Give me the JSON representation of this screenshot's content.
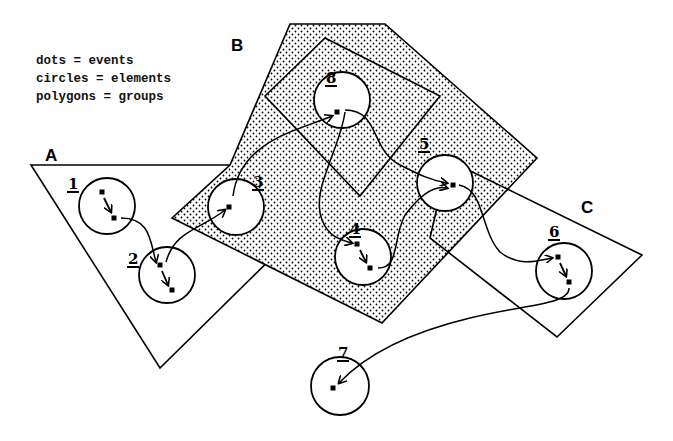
{
  "legend": {
    "lines": [
      "dots = events",
      "circles = elements",
      "polygons = groups"
    ]
  },
  "groups": [
    {
      "id": "A",
      "label": "A",
      "label_pos": [
        45,
        146
      ],
      "shaded": false,
      "points": [
        [
          31,
          165
        ],
        [
          232,
          165
        ],
        [
          292,
          238
        ],
        [
          160,
          368
        ]
      ]
    },
    {
      "id": "B",
      "label": "B",
      "label_pos": [
        231,
        36
      ],
      "shaded": true,
      "points": [
        [
          290,
          24
        ],
        [
          385,
          24
        ],
        [
          537,
          158
        ],
        [
          382,
          323
        ],
        [
          172,
          218
        ],
        [
          230,
          165
        ]
      ]
    },
    {
      "id": "B-inner",
      "label": "",
      "shaded": false,
      "points": [
        [
          325,
          38
        ],
        [
          440,
          96
        ],
        [
          360,
          196
        ],
        [
          265,
          96
        ]
      ]
    },
    {
      "id": "C",
      "label": "C",
      "label_pos": [
        581,
        198
      ],
      "shaded": false,
      "points": [
        [
          448,
          160
        ],
        [
          642,
          255
        ],
        [
          557,
          337
        ],
        [
          430,
          238
        ]
      ]
    }
  ],
  "elements": [
    {
      "id": "1",
      "label": "1",
      "cx": 107,
      "cy": 206,
      "r": 28,
      "label_pos": [
        67,
        177
      ]
    },
    {
      "id": "2",
      "label": "2",
      "cx": 167,
      "cy": 275,
      "r": 28,
      "label_pos": [
        127,
        252
      ]
    },
    {
      "id": "3",
      "label": "3",
      "cx": 236,
      "cy": 207,
      "r": 28,
      "label_pos": [
        252,
        175
      ]
    },
    {
      "id": "4",
      "label": "4",
      "cx": 363,
      "cy": 257,
      "r": 28,
      "label_pos": [
        349,
        222
      ]
    },
    {
      "id": "5",
      "label": "5",
      "cx": 445,
      "cy": 183,
      "r": 28,
      "label_pos": [
        418,
        137
      ]
    },
    {
      "id": "6",
      "label": "6",
      "cx": 564,
      "cy": 271,
      "r": 28,
      "label_pos": [
        548,
        225
      ]
    },
    {
      "id": "7",
      "label": "7",
      "cx": 340,
      "cy": 386,
      "r": 29,
      "label_pos": [
        337,
        346
      ]
    },
    {
      "id": "8",
      "label": "8",
      "cx": 342,
      "cy": 100,
      "r": 28,
      "label_pos": [
        325,
        71
      ]
    }
  ],
  "events": [
    [
      102,
      192
    ],
    [
      114,
      218
    ],
    [
      160,
      265
    ],
    [
      172,
      290
    ],
    [
      229,
      207
    ],
    [
      337,
      112
    ],
    [
      357,
      244
    ],
    [
      370,
      268
    ],
    [
      453,
      185
    ],
    [
      558,
      257
    ],
    [
      569,
      282
    ],
    [
      333,
      388
    ]
  ],
  "arrows": [
    {
      "from": "1",
      "to": "2",
      "path": "M121,218 C150,218 150,240 156,262"
    },
    {
      "from": "2",
      "to": "3",
      "path": "M166,262 C175,230 200,230 225,210"
    },
    {
      "from": "3",
      "to": "8",
      "path": "M233,196 C240,140 300,130 332,116"
    },
    {
      "from": "8",
      "to": "4",
      "path": "M345,112 C340,150 310,190 322,220 C328,236 340,240 352,243"
    },
    {
      "from": "8",
      "to": "5",
      "path": "M345,110 C380,110 370,150 400,165 C420,175 430,180 447,183"
    },
    {
      "from": "4",
      "to": "5",
      "path": "M378,268 C400,268 392,240 405,215 C420,195 435,185 447,188"
    },
    {
      "from": "5",
      "to": "6",
      "path": "M459,185 C485,190 480,230 500,252 C520,268 540,260 552,258"
    },
    {
      "from": "6",
      "to": "7",
      "path": "M569,288 C570,305 520,305 470,318 C420,330 370,350 339,383"
    },
    {
      "from": "1",
      "to": "1b",
      "path": "M104,198 L111,212",
      "short": true
    },
    {
      "from": "2",
      "to": "2b",
      "path": "M162,271 L168,285",
      "short": true
    },
    {
      "from": "4",
      "to": "4b",
      "path": "M360,250 L366,262",
      "short": true
    },
    {
      "from": "6",
      "to": "6b",
      "path": "M560,263 L566,276",
      "short": true
    }
  ],
  "colors": {
    "ink": "#000000",
    "dot_fill": "#e9e9e9",
    "background": "#ffffff"
  }
}
